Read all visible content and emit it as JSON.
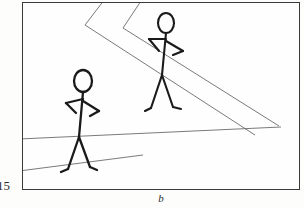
{
  "page": {
    "page_number": "15",
    "background_color": "#fdfdfc"
  },
  "figure": {
    "caption_label": "b",
    "frame_color": "#3a3a3a",
    "panel_color": "#fefefe",
    "ink_color": "#1a1a1a",
    "ground_line_color": "#6b6b6b"
  },
  "scene": {
    "description": "Two stick figures walking on a ground plane marked by receding chevron lines",
    "ground_lines": [
      {
        "name": "chevron-line-1",
        "points": "85,-8 62,22 232,132"
      },
      {
        "name": "chevron-line-2",
        "points": "122,-8 100,25 256,123"
      },
      {
        "name": "ground-line-3",
        "points": "-4,136 258,124"
      },
      {
        "name": "ground-line-4",
        "points": "-4,168 120,152"
      }
    ],
    "figures": [
      {
        "name": "stick-figure-back",
        "position": "upper-right",
        "head_center": [
          143,
          20
        ],
        "head_radius": [
          8,
          10
        ],
        "spine": "143,30 139,72",
        "limbs": [
          "143,36 126,36",
          "126,36 136,48",
          "143,38 160,48",
          "160,48 150,52",
          "139,72 128,105",
          "128,105 122,108",
          "139,72 150,104",
          "150,104 158,106"
        ]
      },
      {
        "name": "stick-figure-front",
        "position": "lower-left",
        "head_center": [
          60,
          78
        ],
        "head_radius": [
          9,
          11
        ],
        "spine": "60,89 56,134",
        "limbs": [
          "60,96 43,100",
          "43,100 53,110",
          "60,98 76,108",
          "76,108 67,113",
          "56,134 45,166",
          "45,166 38,169",
          "56,134 67,164",
          "67,164 74,167"
        ]
      }
    ]
  }
}
